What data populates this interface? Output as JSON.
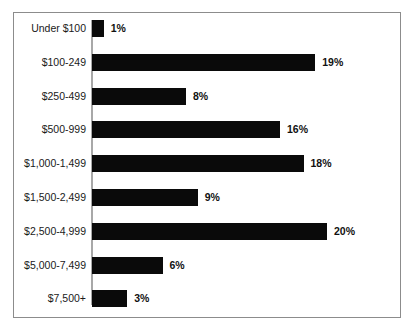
{
  "chart": {
    "top_clipped_text": "",
    "frame_color": "#8c8c8c",
    "axis_color": "#a8a8a8",
    "bar_color": "#0a0a0a",
    "label_color": "#1a1a1a"
  },
  "chart_data": {
    "type": "bar",
    "orientation": "horizontal",
    "title": "",
    "subtitle": "",
    "xlabel": "",
    "ylabel": "",
    "grid": false,
    "legend": false,
    "legend_position": "none",
    "value_suffix": "%",
    "xlim": [
      0,
      20
    ],
    "categories": [
      "Under $100",
      "$100-249",
      "$250-499",
      "$500-999",
      "$1,000-1,499",
      "$1,500-2,499",
      "$2,500-4,999",
      "$5,000-7,499",
      "$7,500+"
    ],
    "values": [
      1,
      19,
      8,
      16,
      18,
      9,
      20,
      6,
      3
    ],
    "data_labels": [
      "1%",
      "19%",
      "8%",
      "16%",
      "18%",
      "9%",
      "20%",
      "6%",
      "3%"
    ]
  }
}
